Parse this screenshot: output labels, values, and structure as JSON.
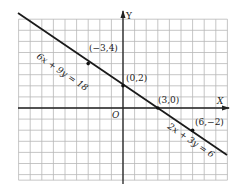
{
  "axes": {
    "x_label": "X",
    "y_label": "Y",
    "origin_label": "O"
  },
  "grid": {
    "x_min": -9,
    "x_max": 9,
    "y_min": -6.5,
    "y_max": 8,
    "line_color": "#b8b8b8",
    "axis_color": "#222222"
  },
  "lines": [
    {
      "equation": "6x + 9y = 18",
      "label": "6x + 9y = 18"
    },
    {
      "equation": "2x + 3y = 6",
      "label": "2x + 3y = 6"
    }
  ],
  "points": [
    {
      "x": -3,
      "y": 4,
      "label": "(−3,4)"
    },
    {
      "x": 0,
      "y": 2,
      "label": "(0,2)"
    },
    {
      "x": 3,
      "y": 0,
      "label": "(3,0)"
    },
    {
      "x": 6,
      "y": -2,
      "label": "(6,−2)"
    }
  ]
}
